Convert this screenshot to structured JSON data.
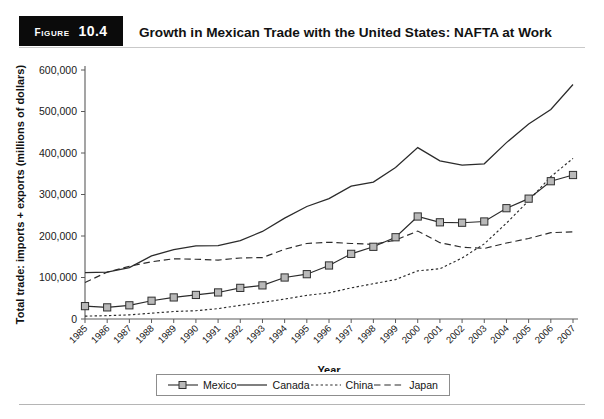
{
  "figure": {
    "badge_word": "Figure",
    "badge_number": "10.4",
    "title": "Growth in Mexican Trade with the United States: NAFTA at Work"
  },
  "chart_data": {
    "type": "line",
    "title": "Growth in Mexican Trade with the United States: NAFTA at Work",
    "xlabel": "Year",
    "ylabel": "Total trade: imports + exports (millions of dollars)",
    "grid": false,
    "legend_position": "bottom",
    "ylim": [
      0,
      600000
    ],
    "yticks": [
      0,
      100000,
      200000,
      300000,
      400000,
      500000,
      600000
    ],
    "ytick_labels": [
      "0",
      "100,000",
      "200,000",
      "300,000",
      "400,000",
      "500,000",
      "600,000"
    ],
    "categories": [
      "1985",
      "1986",
      "1987",
      "1988",
      "1989",
      "1990",
      "1991",
      "1992",
      "1993",
      "1994",
      "1995",
      "1996",
      "1997",
      "1998",
      "1999",
      "2000",
      "2001",
      "2002",
      "2003",
      "2004",
      "2005",
      "2006",
      "2007"
    ],
    "series": [
      {
        "name": "Mexico",
        "style": "solid-with-square-markers",
        "marker": "square",
        "values": [
          31000,
          28000,
          33000,
          44000,
          52000,
          58000,
          64000,
          75000,
          81000,
          100000,
          108000,
          129000,
          157000,
          174000,
          197000,
          247000,
          233000,
          232000,
          235000,
          267000,
          290000,
          332000,
          347000
        ]
      },
      {
        "name": "Canada",
        "style": "solid",
        "marker": "none",
        "values": [
          112000,
          113000,
          124000,
          152000,
          167000,
          176000,
          177000,
          189000,
          211000,
          243000,
          271000,
          290000,
          320000,
          330000,
          365000,
          413000,
          381000,
          371000,
          374000,
          425000,
          470000,
          505000,
          565000
        ]
      },
      {
        "name": "China",
        "style": "dotted",
        "marker": "none",
        "values": [
          7000,
          8000,
          10000,
          14000,
          18000,
          20000,
          25000,
          33000,
          40000,
          48000,
          57000,
          63000,
          75000,
          85000,
          95000,
          116000,
          121000,
          147000,
          181000,
          231000,
          285000,
          343000,
          387000
        ]
      },
      {
        "name": "Japan",
        "style": "dashed",
        "marker": "none",
        "values": [
          88000,
          113000,
          127000,
          138000,
          145000,
          144000,
          142000,
          147000,
          148000,
          168000,
          182000,
          185000,
          182000,
          180000,
          190000,
          212000,
          184000,
          173000,
          170000,
          183000,
          194000,
          208000,
          210000
        ]
      }
    ]
  },
  "legend": {
    "items": [
      {
        "label": "Mexico",
        "icon": "line-with-square-marker"
      },
      {
        "label": "Canada",
        "icon": "solid-line"
      },
      {
        "label": "China",
        "icon": "dotted-line"
      },
      {
        "label": "Japan",
        "icon": "dashed-line"
      }
    ]
  }
}
